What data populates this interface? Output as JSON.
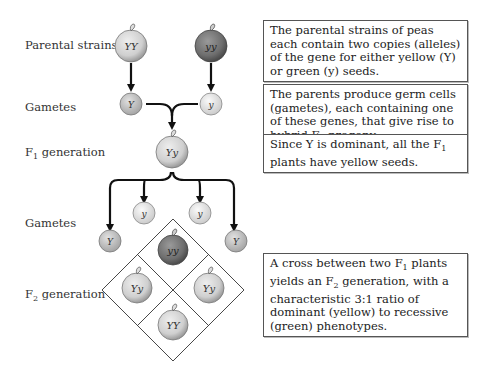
{
  "labels": {
    "parental": "Parental strains",
    "gametes1": "Gametes",
    "f1_prefix": "F",
    "f1_sub": "1",
    "f1_suffix": " generation",
    "gametes2": "Gametes",
    "f2_prefix": "F",
    "f2_sub": "2",
    "f2_suffix": " generation"
  },
  "notes": {
    "n1": "The parental strains of peas each contain two copies (alleles) of the gene for either yellow (Y) or green (y) seeds.",
    "n2_a": "The parents produce germ cells (gametes), each containing one of these genes, that give rise to hybrid F",
    "n2_sub": "1",
    "n2_b": " progeny.",
    "n3_a": "Since Y is dominant, all the F",
    "n3_sub": "1",
    "n3_b": " plants have yellow seeds.",
    "n4_a": "A cross between two F",
    "n4_sub1": "1",
    "n4_b": " plants yields an F",
    "n4_sub2": "2",
    "n4_c": " generation, with a characteristic 3:1 ratio of dominant (yellow) to recessive (green) phenotypes."
  },
  "peas": {
    "parent_yellow": "YY",
    "parent_green": "yy",
    "gamete_Y": "Y",
    "gamete_y": "y",
    "f1": "Yy",
    "f2_gamete_left": "Y",
    "f2_gamete_y1": "y",
    "f2_gamete_y2": "y",
    "f2_gamete_right": "Y",
    "f2_top": "yy",
    "f2_left": "Yy",
    "f2_right": "Yy",
    "f2_bottom": "YY"
  },
  "colors": {
    "yellow_pea": "#d6d6d6",
    "green_pea": "#7a7a7a",
    "line": "#111111"
  }
}
